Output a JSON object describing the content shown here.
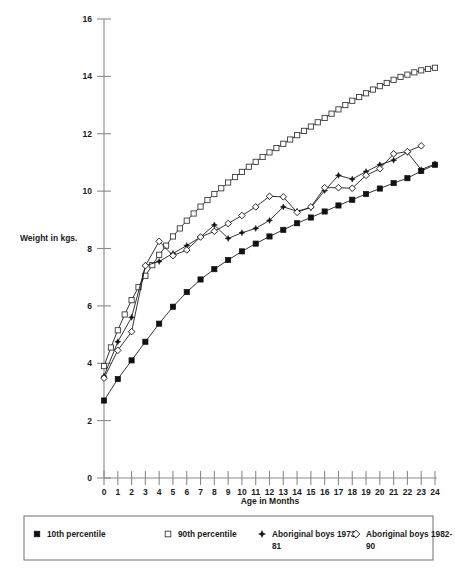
{
  "chart_data": {
    "type": "line",
    "title": "",
    "xlabel": "Age in Months",
    "ylabel": "Weight in kgs.",
    "xlim": [
      0,
      24
    ],
    "ylim": [
      0,
      16
    ],
    "xticks": [
      0,
      1,
      2,
      3,
      4,
      5,
      6,
      7,
      8,
      9,
      10,
      11,
      12,
      13,
      14,
      15,
      16,
      17,
      18,
      19,
      20,
      21,
      22,
      23,
      24
    ],
    "xtick_labels": [
      "0",
      "1",
      "2",
      "3",
      "4",
      "5",
      "6",
      "7",
      "8",
      "9",
      "10",
      "11",
      "12",
      "13",
      "14",
      "15",
      "16",
      "17",
      "18",
      "19",
      "20",
      "21",
      "22",
      "23",
      "24"
    ],
    "yticks": [
      0,
      2,
      4,
      6,
      8,
      10,
      12,
      14,
      16
    ],
    "ytick_labels": [
      "0",
      "2",
      "4",
      "6",
      "8",
      "10",
      "12",
      "14",
      "16"
    ],
    "grid": false,
    "legend_position": "bottom",
    "series": [
      {
        "name": "10th percentile",
        "marker": "filled-square",
        "x": [
          0,
          1,
          2,
          3,
          4,
          5,
          6,
          7,
          8,
          9,
          10,
          11,
          12,
          13,
          14,
          15,
          16,
          17,
          18,
          19,
          20,
          21,
          22,
          23,
          24
        ],
        "values": [
          2.7,
          3.45,
          4.1,
          4.75,
          5.38,
          5.97,
          6.48,
          6.92,
          7.28,
          7.6,
          7.9,
          8.17,
          8.42,
          8.65,
          8.88,
          9.08,
          9.29,
          9.5,
          9.7,
          9.9,
          10.09,
          10.28,
          10.45,
          10.7,
          10.92
        ]
      },
      {
        "name": "90th percentile",
        "marker": "open-square",
        "x": [
          0,
          0.5,
          1,
          1.5,
          2,
          2.5,
          3,
          3.5,
          4,
          4.5,
          5,
          5.5,
          6,
          6.5,
          7,
          7.5,
          8,
          8.5,
          9,
          9.5,
          10,
          10.5,
          11,
          11.5,
          12,
          12.5,
          13,
          13.5,
          14,
          14.5,
          15,
          15.5,
          16,
          16.5,
          17,
          17.5,
          18,
          18.5,
          19,
          19.5,
          20,
          20.5,
          21,
          21.5,
          22,
          22.5,
          23,
          23.5,
          24
        ],
        "values": [
          3.9,
          4.55,
          5.15,
          5.7,
          6.2,
          6.65,
          7.05,
          7.42,
          7.78,
          8.1,
          8.42,
          8.7,
          8.97,
          9.22,
          9.46,
          9.69,
          9.9,
          10.1,
          10.3,
          10.49,
          10.67,
          10.85,
          11.02,
          11.19,
          11.35,
          11.5,
          11.65,
          11.8,
          11.95,
          12.1,
          12.25,
          12.4,
          12.55,
          12.7,
          12.85,
          13.0,
          13.15,
          13.28,
          13.41,
          13.54,
          13.66,
          13.77,
          13.88,
          13.98,
          14.06,
          14.14,
          14.21,
          14.26,
          14.3
        ]
      },
      {
        "name": "Aboriginal boys 1973-81",
        "marker": "star",
        "x": [
          0,
          1,
          2,
          3,
          4,
          5,
          6,
          7,
          8,
          9,
          10,
          11,
          12,
          13,
          14,
          15,
          16,
          17,
          18,
          19,
          20,
          21,
          22,
          23,
          24
        ],
        "values": [
          3.55,
          4.75,
          5.6,
          7.4,
          7.55,
          7.83,
          8.1,
          8.4,
          8.82,
          8.35,
          8.55,
          8.7,
          8.98,
          9.45,
          9.3,
          9.42,
          10.02,
          10.55,
          10.42,
          10.68,
          10.92,
          11.08,
          11.35,
          10.75,
          10.95
        ]
      },
      {
        "name": "Aboriginal boys 1982-90",
        "marker": "open-diamond",
        "x": [
          0,
          1,
          2,
          3,
          4,
          5,
          6,
          7,
          8,
          9,
          10,
          11,
          12,
          13,
          14,
          15,
          16,
          17,
          18,
          19,
          20,
          21,
          22,
          23
        ],
        "values": [
          3.48,
          4.45,
          5.1,
          7.4,
          8.25,
          7.75,
          7.95,
          8.4,
          8.6,
          8.87,
          9.15,
          9.45,
          9.82,
          9.8,
          9.26,
          9.45,
          10.12,
          10.12,
          10.1,
          10.55,
          10.78,
          11.3,
          11.38,
          11.58
        ]
      }
    ]
  },
  "legend": {
    "entries": [
      {
        "label": "10th percentile",
        "label_line2": "",
        "marker": "filled-square"
      },
      {
        "label": "90th percentile",
        "label_line2": "",
        "marker": "open-square"
      },
      {
        "label": "Aboriginal boys 1973-",
        "label_line2": "81",
        "marker": "star"
      },
      {
        "label": "Aboriginal boys 1982-",
        "label_line2": "90",
        "marker": "open-diamond"
      }
    ]
  },
  "colors": {
    "ink": "#111111",
    "axis": "#8a8a8a",
    "legend_border": "#6f6f6f",
    "background": "#ffffff"
  }
}
